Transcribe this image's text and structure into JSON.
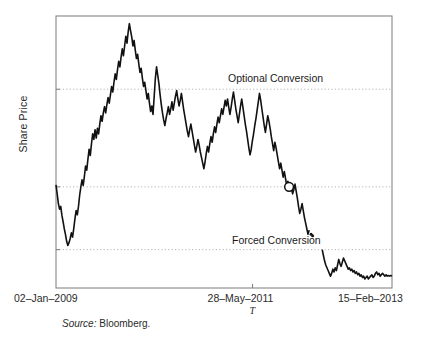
{
  "figure": {
    "source_prefix": "Source:",
    "source_value": "Bloomberg.",
    "background": "#ffffff"
  },
  "chart_data": {
    "type": "line",
    "title": "",
    "xlabel": "T",
    "ylabel": "Share Price",
    "grid": true,
    "legend_position": "none",
    "line_color": "#111111",
    "grid_color": "#b4b4b4",
    "axis_color": "#7a7a7a",
    "xlim": [
      "02-Jan-2009",
      "15-Feb-2013"
    ],
    "ylim": [
      0.45,
      4.35
    ],
    "ytick_values": [
      3.3,
      1.9,
      1.0
    ],
    "ytick_labels": [
      "3.3",
      "1.9",
      "1.0"
    ],
    "xtick_labels": [
      "02–Jan–2009",
      "28–May–2011",
      "15–Feb–2013"
    ],
    "annotations": [
      {
        "name": "optional-conversion",
        "text": "Optional Conversion",
        "y_level": 3.3
      },
      {
        "name": "forced-conversion",
        "text": "Forced Conversion",
        "y_level": 1.0
      }
    ],
    "marker": {
      "name": "conversion-marker",
      "x_label": "28–May–2011",
      "y": 1.9,
      "style": "open-circle"
    },
    "series": [
      {
        "name": "Share Price (pre-conversion)",
        "values": [
          1.93,
          1.8,
          1.66,
          1.58,
          1.62,
          1.49,
          1.4,
          1.3,
          1.22,
          1.12,
          1.06,
          1.1,
          1.16,
          1.24,
          1.18,
          1.3,
          1.44,
          1.56,
          1.5,
          1.62,
          1.78,
          1.9,
          2.0,
          1.92,
          2.05,
          2.2,
          2.14,
          2.3,
          2.44,
          2.35,
          2.52,
          2.66,
          2.58,
          2.72,
          2.6,
          2.74,
          2.66,
          2.8,
          2.92,
          2.84,
          2.96,
          3.05,
          2.96,
          3.08,
          3.18,
          3.1,
          3.22,
          3.34,
          3.26,
          3.4,
          3.52,
          3.44,
          3.58,
          3.7,
          3.62,
          3.76,
          3.88,
          3.78,
          3.92,
          4.06,
          3.96,
          4.12,
          4.24,
          4.14,
          4.05,
          3.92,
          4.0,
          3.86,
          3.74,
          3.8,
          3.66,
          3.54,
          3.6,
          3.46,
          3.34,
          3.4,
          3.28,
          3.16,
          3.24,
          3.1,
          2.98,
          3.06,
          2.94,
          3.2,
          3.46,
          3.62,
          3.5,
          3.38,
          3.22,
          3.08,
          2.96,
          2.86,
          2.78,
          2.88,
          2.96,
          3.05,
          2.94,
          3.02,
          3.12,
          3.0,
          3.1,
          3.2,
          3.28,
          3.16,
          3.06,
          3.14,
          3.24,
          3.12,
          3.0,
          2.9,
          2.8,
          2.7,
          2.62,
          2.72,
          2.8,
          2.7,
          2.6,
          2.5,
          2.4,
          2.48,
          2.58,
          2.5,
          2.4,
          2.32,
          2.24,
          2.16,
          2.26,
          2.38,
          2.48,
          2.4,
          2.52,
          2.62,
          2.54,
          2.66,
          2.76,
          2.68,
          2.8,
          2.9,
          2.82,
          2.92,
          3.02,
          2.94,
          3.04,
          3.14,
          3.06,
          3.16,
          3.04,
          2.94,
          3.04,
          3.16,
          3.26,
          3.14,
          3.02,
          2.92,
          2.82,
          2.94,
          3.06,
          3.16,
          3.04,
          2.92,
          2.8,
          2.7,
          2.58,
          2.46,
          2.36,
          2.44,
          2.56,
          2.66,
          2.78,
          2.88,
          3.0,
          3.12,
          3.24,
          3.14,
          3.02,
          2.9,
          2.78,
          2.68,
          2.8,
          2.92,
          2.84,
          2.74,
          2.62,
          2.52,
          2.42,
          2.54,
          2.46,
          2.36,
          2.26,
          2.16,
          2.24,
          2.14,
          2.04,
          2.12,
          2.02,
          1.92,
          1.98,
          1.9,
          1.96,
          1.88,
          1.8,
          1.86,
          1.94,
          1.84,
          1.74,
          1.62,
          1.52,
          1.58,
          1.66,
          1.56,
          1.46,
          1.38,
          1.3,
          1.22,
          1.28
        ],
        "gap_after": true
      },
      {
        "name": "Share Price (post-conversion)",
        "values": [
          1.0,
          0.92,
          0.84,
          0.78,
          0.74,
          0.7,
          0.66,
          0.62,
          0.66,
          0.72,
          0.68,
          0.74,
          0.7,
          0.78,
          0.86,
          0.8,
          0.76,
          0.82,
          0.88,
          0.84,
          0.8,
          0.76,
          0.72,
          0.74,
          0.7,
          0.72,
          0.68,
          0.7,
          0.66,
          0.68,
          0.64,
          0.66,
          0.62,
          0.64,
          0.6,
          0.62,
          0.58,
          0.6,
          0.62,
          0.58,
          0.6,
          0.62,
          0.64,
          0.6,
          0.62,
          0.66,
          0.68,
          0.64,
          0.66,
          0.62,
          0.64,
          0.66,
          0.64,
          0.62,
          0.64,
          0.62,
          0.63,
          0.62,
          0.63,
          0.62
        ]
      }
    ]
  }
}
